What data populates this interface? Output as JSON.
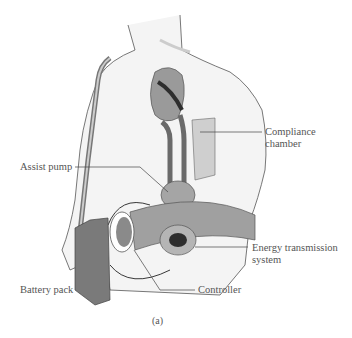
{
  "figure": {
    "caption": "(a)",
    "labels": {
      "compliance_chamber_1": "Compliance",
      "compliance_chamber_2": "chamber",
      "assist_pump": "Assist pump",
      "energy_1": "Energy transmission",
      "energy_2": "system",
      "battery_pack": "Battery pack",
      "controller": "Controller"
    },
    "colors": {
      "skin": "#f4f4f4",
      "outline": "#555555",
      "device": "#8a8a8a",
      "dark": "#3a3a3a",
      "belt": "#9a9a9a"
    }
  }
}
